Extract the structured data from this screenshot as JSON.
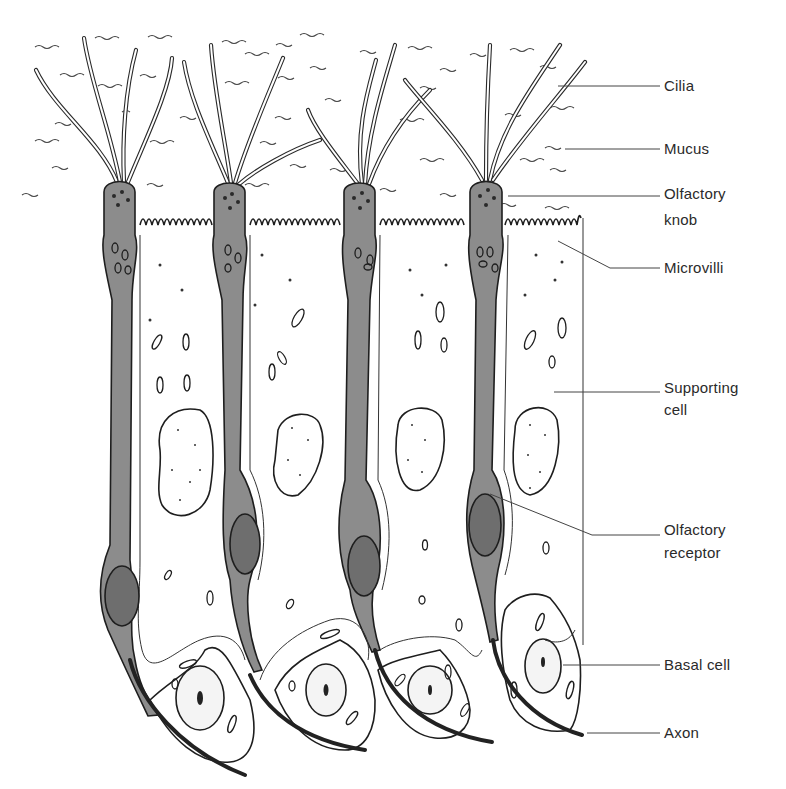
{
  "figure": {
    "colors": {
      "receptor_fill": "#8c8c8c",
      "ink": "#1e1e1e",
      "background": "#ffffff"
    }
  },
  "labels": [
    {
      "id": "cilia",
      "text": "Cilia"
    },
    {
      "id": "mucus",
      "text": "Mucus"
    },
    {
      "id": "olfactory_knob_1",
      "text": "Olfactory"
    },
    {
      "id": "olfactory_knob_2",
      "text": "knob"
    },
    {
      "id": "microvilli",
      "text": "Microvilli"
    },
    {
      "id": "supporting_cell_1",
      "text": "Supporting"
    },
    {
      "id": "supporting_cell_2",
      "text": "cell"
    },
    {
      "id": "olfactory_receptor_1",
      "text": "Olfactory"
    },
    {
      "id": "olfactory_receptor_2",
      "text": "receptor"
    },
    {
      "id": "basal_cell",
      "text": "Basal cell"
    },
    {
      "id": "axon",
      "text": "Axon"
    }
  ]
}
